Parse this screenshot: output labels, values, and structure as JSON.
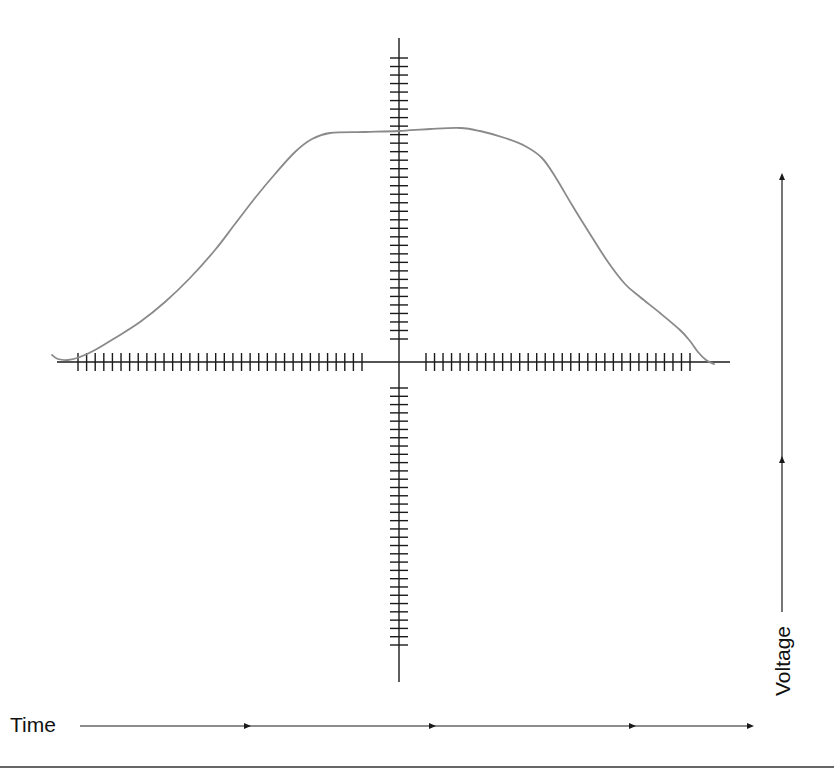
{
  "diagram": {
    "type": "oscilloscope-style trace on crosshair axes",
    "labels": {
      "time": "Time",
      "voltage": "Voltage"
    },
    "colors": {
      "axis": "#1a1a1a",
      "curve": "#8a8a8a",
      "background": "#ffffff"
    },
    "horizontal_axis": {
      "y": 362,
      "x_start": 57,
      "x_end": 730,
      "left_ticks": {
        "count": 34,
        "x_first": 78,
        "x_last": 362,
        "half_height": 9
      },
      "right_ticks": {
        "count": 32,
        "x_first": 426,
        "x_last": 690,
        "half_height": 9
      }
    },
    "vertical_axis": {
      "x": 399,
      "y_start": 38,
      "y_end": 682,
      "upper_ticks": {
        "count": 34,
        "y_first": 58,
        "y_last": 339,
        "half_width": 9
      },
      "lower_ticks": {
        "count": 32,
        "y_first": 388,
        "y_last": 645,
        "half_width": 9
      }
    },
    "time_arrow": {
      "y": 726,
      "x_start": 80,
      "x_end": 752,
      "mid_arrowheads_x": [
        247,
        432,
        632
      ]
    },
    "voltage_arrow": {
      "x": 782,
      "y_start": 612,
      "y_end": 175,
      "mid_arrowheads_y": [
        460
      ]
    },
    "bottom_rule": {
      "y": 767,
      "x_start": 0,
      "x_end": 834
    },
    "curve_points": [
      [
        52,
        355
      ],
      [
        58,
        359
      ],
      [
        68,
        360
      ],
      [
        80,
        357
      ],
      [
        95,
        350
      ],
      [
        115,
        338
      ],
      [
        140,
        322
      ],
      [
        165,
        302
      ],
      [
        190,
        278
      ],
      [
        215,
        250
      ],
      [
        235,
        224
      ],
      [
        255,
        198
      ],
      [
        275,
        174
      ],
      [
        295,
        152
      ],
      [
        312,
        139
      ],
      [
        330,
        133
      ],
      [
        365,
        132
      ],
      [
        399,
        131
      ],
      [
        430,
        129
      ],
      [
        460,
        128
      ],
      [
        480,
        131
      ],
      [
        505,
        138
      ],
      [
        525,
        146
      ],
      [
        542,
        158
      ],
      [
        556,
        178
      ],
      [
        572,
        205
      ],
      [
        590,
        234
      ],
      [
        608,
        262
      ],
      [
        625,
        284
      ],
      [
        640,
        297
      ],
      [
        660,
        313
      ],
      [
        680,
        330
      ],
      [
        690,
        341
      ],
      [
        698,
        352
      ],
      [
        706,
        360
      ],
      [
        714,
        364
      ]
    ]
  }
}
